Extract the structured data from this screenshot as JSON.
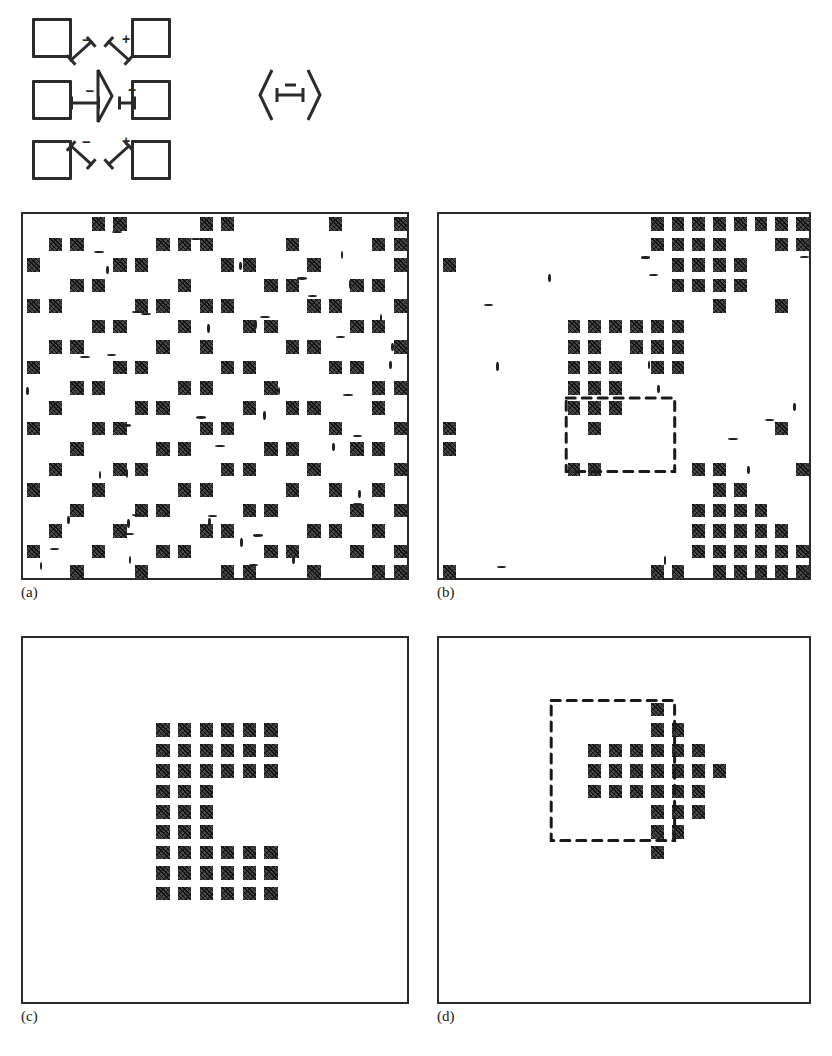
{
  "figure": {
    "caption_labels": [
      "(a)",
      "(b)",
      "(c)",
      "(d)"
    ],
    "panel_count": 4
  },
  "schematic": {
    "name": "cell-interaction-schematic",
    "description": "Center neuron with eight neighbouring square cells",
    "neighbor_cell_label": "square-cell",
    "neighbor_cells": [
      {
        "x": 32,
        "y": 18,
        "w": 34,
        "h": 34,
        "pos": "top-left"
      },
      {
        "x": 131,
        "y": 18,
        "w": 34,
        "h": 34,
        "pos": "top-right"
      },
      {
        "x": 32,
        "y": 80,
        "w": 34,
        "h": 34,
        "pos": "mid-left"
      },
      {
        "x": 131,
        "y": 80,
        "w": 34,
        "h": 34,
        "pos": "mid-right"
      },
      {
        "x": 32,
        "y": 140,
        "w": 34,
        "h": 34,
        "pos": "bottom-left"
      },
      {
        "x": 131,
        "y": 140,
        "w": 34,
        "h": 34,
        "pos": "bottom-right"
      }
    ],
    "connections": [
      {
        "sign": "−",
        "from": "top-left",
        "angle": 42,
        "x": 70,
        "y": 54,
        "len": 30
      },
      {
        "sign": "+",
        "from": "top-right",
        "angle": 138,
        "x": 130,
        "y": 54,
        "len": 30
      },
      {
        "sign": "−",
        "from": "mid-left",
        "angle": 0,
        "x": 70,
        "y": 96,
        "len": 30
      },
      {
        "sign": "+",
        "from": "mid-right",
        "angle": 0,
        "x": 118,
        "y": 96,
        "len": 18
      },
      {
        "sign": "−",
        "from": "bottom-left",
        "angle": -42,
        "x": 70,
        "y": 138,
        "len": 30
      },
      {
        "sign": "+",
        "from": "bottom-right",
        "angle": -138,
        "x": 130,
        "y": 138,
        "len": 30
      }
    ],
    "center_neuron": {
      "name": "center-neuron-triangle",
      "x": 96,
      "y": 68,
      "w": 18,
      "h": 56
    }
  },
  "legend": {
    "name": "mutual-inhibition-legend",
    "sign": "−",
    "left_neuron": "neuron-triangle-left",
    "right_neuron": "neuron-triangle-right",
    "x": 258,
    "y": 66,
    "w": 64,
    "h": 58
  },
  "panels": [
    {
      "id": "a",
      "label": "(a)",
      "title": "initial noisy state",
      "x": 21,
      "y": 212,
      "w": 388,
      "h": 368,
      "cols": 18,
      "rows": 18,
      "cells": [
        [
          0,
          3
        ],
        [
          0,
          4
        ],
        [
          0,
          8
        ],
        [
          0,
          9
        ],
        [
          0,
          14
        ],
        [
          0,
          17
        ],
        [
          1,
          1
        ],
        [
          1,
          2
        ],
        [
          1,
          6
        ],
        [
          1,
          7
        ],
        [
          1,
          8
        ],
        [
          1,
          12
        ],
        [
          1,
          16
        ],
        [
          1,
          17
        ],
        [
          2,
          0
        ],
        [
          2,
          4
        ],
        [
          2,
          5
        ],
        [
          2,
          9
        ],
        [
          2,
          10
        ],
        [
          2,
          13
        ],
        [
          2,
          17
        ],
        [
          3,
          2
        ],
        [
          3,
          3
        ],
        [
          3,
          7
        ],
        [
          3,
          11
        ],
        [
          3,
          12
        ],
        [
          3,
          15
        ],
        [
          3,
          16
        ],
        [
          4,
          0
        ],
        [
          4,
          1
        ],
        [
          4,
          5
        ],
        [
          4,
          6
        ],
        [
          4,
          8
        ],
        [
          4,
          9
        ],
        [
          4,
          13
        ],
        [
          4,
          14
        ],
        [
          4,
          17
        ],
        [
          5,
          3
        ],
        [
          5,
          4
        ],
        [
          5,
          7
        ],
        [
          5,
          10
        ],
        [
          5,
          11
        ],
        [
          5,
          15
        ],
        [
          5,
          16
        ],
        [
          6,
          1
        ],
        [
          6,
          2
        ],
        [
          6,
          6
        ],
        [
          6,
          8
        ],
        [
          6,
          12
        ],
        [
          6,
          13
        ],
        [
          6,
          17
        ],
        [
          7,
          0
        ],
        [
          7,
          4
        ],
        [
          7,
          5
        ],
        [
          7,
          9
        ],
        [
          7,
          10
        ],
        [
          7,
          14
        ],
        [
          7,
          15
        ],
        [
          8,
          2
        ],
        [
          8,
          3
        ],
        [
          8,
          7
        ],
        [
          8,
          8
        ],
        [
          8,
          11
        ],
        [
          8,
          16
        ],
        [
          8,
          17
        ],
        [
          9,
          1
        ],
        [
          9,
          5
        ],
        [
          9,
          6
        ],
        [
          9,
          10
        ],
        [
          9,
          12
        ],
        [
          9,
          13
        ],
        [
          9,
          16
        ],
        [
          10,
          0
        ],
        [
          10,
          3
        ],
        [
          10,
          4
        ],
        [
          10,
          8
        ],
        [
          10,
          9
        ],
        [
          10,
          14
        ],
        [
          10,
          17
        ],
        [
          11,
          2
        ],
        [
          11,
          6
        ],
        [
          11,
          7
        ],
        [
          11,
          11
        ],
        [
          11,
          12
        ],
        [
          11,
          15
        ],
        [
          11,
          16
        ],
        [
          12,
          1
        ],
        [
          12,
          4
        ],
        [
          12,
          5
        ],
        [
          12,
          9
        ],
        [
          12,
          10
        ],
        [
          12,
          13
        ],
        [
          12,
          17
        ],
        [
          13,
          0
        ],
        [
          13,
          3
        ],
        [
          13,
          7
        ],
        [
          13,
          8
        ],
        [
          13,
          12
        ],
        [
          13,
          14
        ],
        [
          13,
          16
        ],
        [
          14,
          2
        ],
        [
          14,
          5
        ],
        [
          14,
          6
        ],
        [
          14,
          10
        ],
        [
          14,
          11
        ],
        [
          14,
          15
        ],
        [
          14,
          17
        ],
        [
          15,
          1
        ],
        [
          15,
          4
        ],
        [
          15,
          8
        ],
        [
          15,
          9
        ],
        [
          15,
          13
        ],
        [
          15,
          14
        ],
        [
          15,
          16
        ],
        [
          16,
          0
        ],
        [
          16,
          3
        ],
        [
          16,
          6
        ],
        [
          16,
          7
        ],
        [
          16,
          11
        ],
        [
          16,
          12
        ],
        [
          16,
          15
        ],
        [
          16,
          17
        ],
        [
          17,
          2
        ],
        [
          17,
          5
        ],
        [
          17,
          9
        ],
        [
          17,
          10
        ],
        [
          17,
          13
        ],
        [
          17,
          16
        ],
        [
          17,
          17
        ]
      ],
      "noise_marks": 46,
      "dashed_contour": false
    },
    {
      "id": "b",
      "label": "(b)",
      "title": "intermediate relaxation state",
      "x": 437,
      "y": 212,
      "w": 374,
      "h": 368,
      "cols": 18,
      "rows": 18,
      "cells": [
        [
          0,
          10
        ],
        [
          0,
          11
        ],
        [
          0,
          12
        ],
        [
          0,
          13
        ],
        [
          0,
          14
        ],
        [
          0,
          15
        ],
        [
          0,
          16
        ],
        [
          0,
          17
        ],
        [
          1,
          10
        ],
        [
          1,
          11
        ],
        [
          1,
          12
        ],
        [
          1,
          13
        ],
        [
          1,
          16
        ],
        [
          1,
          17
        ],
        [
          2,
          0
        ],
        [
          2,
          11
        ],
        [
          2,
          12
        ],
        [
          2,
          13
        ],
        [
          2,
          14
        ],
        [
          3,
          11
        ],
        [
          3,
          12
        ],
        [
          3,
          13
        ],
        [
          3,
          14
        ],
        [
          4,
          13
        ],
        [
          4,
          16
        ],
        [
          5,
          6
        ],
        [
          5,
          7
        ],
        [
          5,
          8
        ],
        [
          5,
          9
        ],
        [
          5,
          10
        ],
        [
          5,
          11
        ],
        [
          6,
          6
        ],
        [
          6,
          7
        ],
        [
          6,
          9
        ],
        [
          6,
          10
        ],
        [
          6,
          11
        ],
        [
          7,
          6
        ],
        [
          7,
          7
        ],
        [
          7,
          8
        ],
        [
          7,
          10
        ],
        [
          7,
          11
        ],
        [
          8,
          6
        ],
        [
          8,
          7
        ],
        [
          8,
          8
        ],
        [
          9,
          6
        ],
        [
          9,
          7
        ],
        [
          9,
          8
        ],
        [
          10,
          0
        ],
        [
          10,
          7
        ],
        [
          10,
          16
        ],
        [
          11,
          0
        ],
        [
          12,
          6
        ],
        [
          12,
          7
        ],
        [
          12,
          12
        ],
        [
          12,
          13
        ],
        [
          12,
          17
        ],
        [
          13,
          13
        ],
        [
          13,
          14
        ],
        [
          14,
          12
        ],
        [
          14,
          13
        ],
        [
          14,
          14
        ],
        [
          14,
          15
        ],
        [
          15,
          12
        ],
        [
          15,
          13
        ],
        [
          15,
          14
        ],
        [
          15,
          15
        ],
        [
          15,
          16
        ],
        [
          16,
          12
        ],
        [
          16,
          13
        ],
        [
          16,
          14
        ],
        [
          16,
          15
        ],
        [
          16,
          16
        ],
        [
          16,
          17
        ],
        [
          17,
          0
        ],
        [
          17,
          10
        ],
        [
          17,
          11
        ],
        [
          17,
          13
        ],
        [
          17,
          14
        ],
        [
          17,
          15
        ],
        [
          17,
          16
        ],
        [
          17,
          17
        ]
      ],
      "noise_marks": 14,
      "dashed_contour": true,
      "contour": {
        "x": 0.34,
        "y": 0.5,
        "w": 0.29,
        "h": 0.2
      }
    },
    {
      "id": "c",
      "label": "(c)",
      "title": "converged letter C",
      "x": 21,
      "y": 636,
      "w": 388,
      "h": 368,
      "cols": 18,
      "rows": 18,
      "cells": [
        [
          4,
          6
        ],
        [
          4,
          7
        ],
        [
          4,
          8
        ],
        [
          4,
          9
        ],
        [
          4,
          10
        ],
        [
          4,
          11
        ],
        [
          5,
          6
        ],
        [
          5,
          7
        ],
        [
          5,
          8
        ],
        [
          5,
          9
        ],
        [
          5,
          10
        ],
        [
          5,
          11
        ],
        [
          6,
          6
        ],
        [
          6,
          7
        ],
        [
          6,
          8
        ],
        [
          6,
          9
        ],
        [
          6,
          10
        ],
        [
          6,
          11
        ],
        [
          7,
          6
        ],
        [
          7,
          7
        ],
        [
          7,
          8
        ],
        [
          8,
          6
        ],
        [
          8,
          7
        ],
        [
          8,
          8
        ],
        [
          9,
          6
        ],
        [
          9,
          7
        ],
        [
          9,
          8
        ],
        [
          10,
          6
        ],
        [
          10,
          7
        ],
        [
          10,
          8
        ],
        [
          10,
          9
        ],
        [
          10,
          10
        ],
        [
          10,
          11
        ],
        [
          11,
          6
        ],
        [
          11,
          7
        ],
        [
          11,
          8
        ],
        [
          11,
          9
        ],
        [
          11,
          10
        ],
        [
          11,
          11
        ],
        [
          12,
          6
        ],
        [
          12,
          7
        ],
        [
          12,
          8
        ],
        [
          12,
          9
        ],
        [
          12,
          10
        ],
        [
          12,
          11
        ]
      ],
      "noise_marks": 0,
      "dashed_contour": false
    },
    {
      "id": "d",
      "label": "(d)",
      "title": "converged alternate interpretation",
      "x": 437,
      "y": 636,
      "w": 374,
      "h": 368,
      "cols": 18,
      "rows": 18,
      "cells": [
        [
          3,
          10
        ],
        [
          4,
          10
        ],
        [
          4,
          11
        ],
        [
          5,
          7
        ],
        [
          5,
          8
        ],
        [
          5,
          9
        ],
        [
          5,
          10
        ],
        [
          5,
          11
        ],
        [
          5,
          12
        ],
        [
          6,
          7
        ],
        [
          6,
          8
        ],
        [
          6,
          9
        ],
        [
          6,
          10
        ],
        [
          6,
          11
        ],
        [
          6,
          12
        ],
        [
          6,
          13
        ],
        [
          7,
          7
        ],
        [
          7,
          8
        ],
        [
          7,
          9
        ],
        [
          7,
          10
        ],
        [
          7,
          11
        ],
        [
          7,
          12
        ],
        [
          8,
          10
        ],
        [
          8,
          11
        ],
        [
          8,
          12
        ],
        [
          9,
          10
        ],
        [
          9,
          11
        ],
        [
          10,
          10
        ]
      ],
      "noise_marks": 0,
      "dashed_contour": true,
      "contour": {
        "x": 0.3,
        "y": 0.17,
        "w": 0.33,
        "h": 0.38
      }
    }
  ]
}
